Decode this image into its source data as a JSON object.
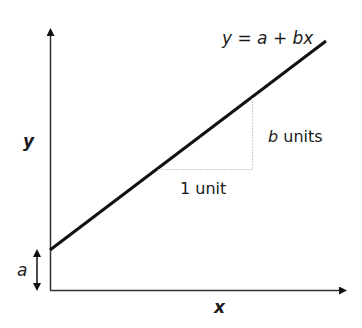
{
  "diagram": {
    "equation": "y = a + bx",
    "y_axis_label": "y",
    "x_axis_label": "x",
    "intercept_label": "a",
    "run_label": "1 unit",
    "rise_label_var": "b",
    "rise_label_unit": " units"
  },
  "colors": {
    "line": "#111111",
    "axis": "#222222",
    "guide": "#c8c8c8",
    "text": "#1a1a1a"
  }
}
